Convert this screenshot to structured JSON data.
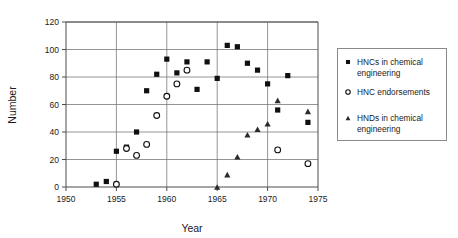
{
  "chart_data": {
    "type": "scatter",
    "title": "",
    "xlabel": "Year",
    "ylabel": "Number",
    "xlim": [
      1950,
      1975
    ],
    "ylim": [
      0,
      120
    ],
    "xticks": [
      1950,
      1955,
      1960,
      1965,
      1970,
      1975
    ],
    "yticks": [
      0,
      20,
      40,
      60,
      80,
      100,
      120
    ],
    "xtick_labels": [
      "1950",
      "1955",
      "1960",
      "1965",
      "1970",
      "1975"
    ],
    "ytick_labels": [
      "0",
      "20",
      "40",
      "60",
      "80",
      "100",
      "120"
    ],
    "grid": "horizontal-and-vertical",
    "legend_position": "right-outside",
    "series": [
      {
        "name": "HNCs in chemical engineering",
        "marker": "filled-square",
        "color": "#101010",
        "points": [
          {
            "x": 1953,
            "y": 2
          },
          {
            "x": 1954,
            "y": 4
          },
          {
            "x": 1955,
            "y": 26
          },
          {
            "x": 1956,
            "y": 29
          },
          {
            "x": 1957,
            "y": 40
          },
          {
            "x": 1958,
            "y": 70
          },
          {
            "x": 1959,
            "y": 82
          },
          {
            "x": 1960,
            "y": 93
          },
          {
            "x": 1961,
            "y": 83
          },
          {
            "x": 1962,
            "y": 91
          },
          {
            "x": 1963,
            "y": 71
          },
          {
            "x": 1964,
            "y": 91
          },
          {
            "x": 1965,
            "y": 79
          },
          {
            "x": 1966,
            "y": 103
          },
          {
            "x": 1967,
            "y": 102
          },
          {
            "x": 1968,
            "y": 90
          },
          {
            "x": 1969,
            "y": 85
          },
          {
            "x": 1970,
            "y": 75
          },
          {
            "x": 1971,
            "y": 56
          },
          {
            "x": 1972,
            "y": 81
          },
          {
            "x": 1974,
            "y": 47
          }
        ]
      },
      {
        "name": "HNC endorsements",
        "marker": "open-circle",
        "color": "#101010",
        "points": [
          {
            "x": 1955,
            "y": 2
          },
          {
            "x": 1956,
            "y": 28
          },
          {
            "x": 1957,
            "y": 23
          },
          {
            "x": 1958,
            "y": 31
          },
          {
            "x": 1959,
            "y": 52
          },
          {
            "x": 1960,
            "y": 66
          },
          {
            "x": 1961,
            "y": 75
          },
          {
            "x": 1962,
            "y": 85
          },
          {
            "x": 1971,
            "y": 27
          },
          {
            "x": 1974,
            "y": 17
          }
        ]
      },
      {
        "name": "HNDs in chemical engineering",
        "marker": "filled-triangle",
        "color": "#2b2b2b",
        "points": [
          {
            "x": 1965,
            "y": 0
          },
          {
            "x": 1966,
            "y": 9
          },
          {
            "x": 1967,
            "y": 22
          },
          {
            "x": 1968,
            "y": 38
          },
          {
            "x": 1969,
            "y": 42
          },
          {
            "x": 1970,
            "y": 46
          },
          {
            "x": 1971,
            "y": 63
          },
          {
            "x": 1974,
            "y": 55
          }
        ]
      }
    ]
  },
  "axes": {
    "x_title": "Year",
    "y_title": "Number"
  },
  "legend": {
    "entries": [
      {
        "label_line1": "HNCs in chemical",
        "label_line2": "engineering",
        "marker": "filled-square"
      },
      {
        "label_line1": "HNC endorsements",
        "label_line2": "",
        "marker": "open-circle"
      },
      {
        "label_line1": "HNDs in chemical",
        "label_line2": "engineering",
        "marker": "filled-triangle"
      }
    ]
  }
}
